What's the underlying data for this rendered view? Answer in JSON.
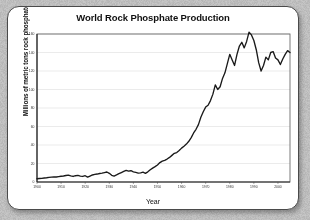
{
  "card": {
    "background": "#ffffff",
    "border_color": "#4a4a4a"
  },
  "page": {
    "background": "#b9b9b9"
  },
  "chart_data": {
    "type": "line",
    "title": "World Rock Phosphate Production",
    "xlabel": "Year",
    "ylabel": "Millions of metric tons rock phosphate",
    "xlim": [
      1900,
      2005
    ],
    "ylim": [
      0,
      160
    ],
    "grid": true,
    "legend": null,
    "line_color": "#1a1a1a",
    "xticks": [
      1900,
      1910,
      1920,
      1930,
      1940,
      1950,
      1960,
      1970,
      1980,
      1990,
      2000
    ],
    "yticks": [
      0,
      20,
      40,
      60,
      80,
      100,
      120,
      140,
      160
    ],
    "series": [
      {
        "name": "World rock phosphate production",
        "x": [
          1900,
          1901,
          1902,
          1903,
          1904,
          1905,
          1906,
          1907,
          1908,
          1909,
          1910,
          1911,
          1912,
          1913,
          1914,
          1915,
          1916,
          1917,
          1918,
          1919,
          1920,
          1921,
          1922,
          1923,
          1924,
          1925,
          1926,
          1927,
          1928,
          1929,
          1930,
          1931,
          1932,
          1933,
          1934,
          1935,
          1936,
          1937,
          1938,
          1939,
          1940,
          1941,
          1942,
          1943,
          1944,
          1945,
          1946,
          1947,
          1948,
          1949,
          1950,
          1951,
          1952,
          1953,
          1954,
          1955,
          1956,
          1957,
          1958,
          1959,
          1960,
          1961,
          1962,
          1963,
          1964,
          1965,
          1966,
          1967,
          1968,
          1969,
          1970,
          1971,
          1972,
          1973,
          1974,
          1975,
          1976,
          1977,
          1978,
          1979,
          1980,
          1981,
          1982,
          1983,
          1984,
          1985,
          1986,
          1987,
          1988,
          1989,
          1990,
          1991,
          1992,
          1993,
          1994,
          1995,
          1996,
          1997,
          1998,
          1999,
          2000,
          2001,
          2002,
          2003,
          2004,
          2005
        ],
        "values": [
          3.5,
          3.8,
          4.0,
          4.3,
          4.6,
          5.0,
          5.3,
          5.6,
          5.4,
          5.8,
          6.2,
          6.5,
          7.0,
          7.4,
          6.6,
          6.0,
          6.8,
          7.2,
          6.4,
          6.0,
          6.8,
          5.2,
          6.4,
          7.6,
          8.2,
          8.6,
          9.2,
          9.6,
          10.2,
          10.8,
          9.4,
          7.2,
          6.4,
          7.6,
          9.0,
          10.2,
          11.4,
          12.6,
          11.8,
          12.2,
          11.0,
          10.4,
          9.6,
          9.8,
          10.6,
          9.4,
          11.0,
          13.2,
          15.0,
          16.6,
          18.4,
          21.0,
          22.6,
          23.4,
          24.8,
          26.6,
          28.8,
          31.0,
          31.8,
          34.0,
          36.6,
          38.6,
          41.0,
          44.0,
          48.0,
          53.0,
          57.0,
          62.0,
          70.0,
          76.0,
          81.0,
          83.0,
          88.0,
          95.0,
          105.0,
          100.0,
          103.0,
          112.0,
          118.0,
          128.0,
          138.0,
          132.0,
          126.0,
          138.0,
          147.0,
          151.0,
          145.0,
          152.0,
          162.0,
          159.0,
          153.0,
          143.0,
          129.0,
          120.0,
          126.0,
          135.0,
          132.0,
          140.0,
          141.0,
          134.0,
          132.0,
          127.0,
          133.0,
          138.0,
          142.0,
          140.0
        ]
      }
    ]
  }
}
